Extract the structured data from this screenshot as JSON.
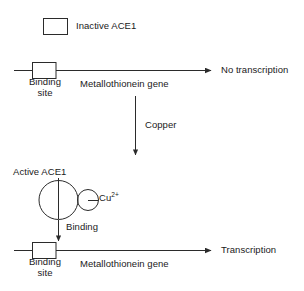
{
  "diagram": {
    "colors": {
      "stroke": "#2b2b2b",
      "text": "#1a1a1a",
      "background": "#ffffff"
    },
    "legend": {
      "shape_name": "inactive-ace1-box",
      "label": "Inactive ACE1"
    },
    "top_pathway": {
      "binding_site_label_line1": "Binding",
      "binding_site_label_line2": "site",
      "gene_label": "Metallothionein gene",
      "outcome": "No transcription"
    },
    "transition": {
      "label": "Copper",
      "arrow_name": "copper-arrow"
    },
    "complex": {
      "label": "Active ACE1",
      "ligand": "Cu",
      "ligand_charge": "2+",
      "binding_label": "Binding"
    },
    "bottom_pathway": {
      "binding_site_label_line1": "Binding",
      "binding_site_label_line2": "site",
      "gene_label": "Metallothionein gene",
      "outcome": "Transcription"
    }
  }
}
